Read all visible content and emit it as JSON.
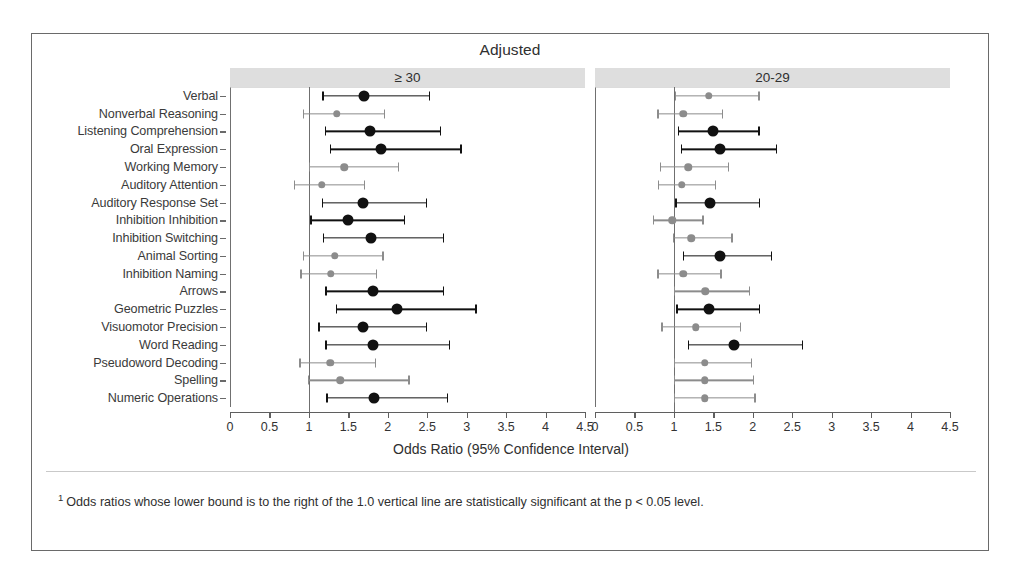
{
  "figure": {
    "title": "Adjusted",
    "x_axis_title": "Odds Ratio (95% Confidence Interval)",
    "footnote_marker": "1",
    "footnote": "Odds ratios whose lower bound is to the right of the 1.0 vertical line are statistically significant at the p < 0.05 level.",
    "reference_value": "1.0",
    "colors": {
      "significant": "#111111",
      "nonsignificant": "#8c8c8c",
      "panel_header_bg": "#dedede",
      "frame": "#6a6a6a",
      "axis": "#5f5f5f"
    }
  },
  "chart_data": {
    "type": "scatter",
    "subtype": "forest-plot",
    "title": "Adjusted",
    "xlabel": "Odds Ratio (95% Confidence Interval)",
    "ylabel": "",
    "xlim": [
      0,
      4.5
    ],
    "xticks": [
      "0",
      "0.5",
      "1",
      "1.5",
      "2",
      "2.5",
      "3",
      "3.5",
      "4",
      "4.5"
    ],
    "xtick_values": [
      0,
      0.5,
      1,
      1.5,
      2,
      2.5,
      3,
      3.5,
      4,
      4.5
    ],
    "grid": false,
    "legend_position": "none",
    "reference_line": 1.0,
    "categories": [
      "Verbal",
      "Nonverbal Reasoning",
      "Listening Comprehension",
      "Oral Expression",
      "Working Memory",
      "Auditory Attention",
      "Auditory Response Set",
      "Inhibition Inhibition",
      "Inhibition Switching",
      "Animal Sorting",
      "Inhibition Naming",
      "Arrows",
      "Geometric Puzzles",
      "Visuomotor Precision",
      "Word Reading",
      "Pseudoword Decoding",
      "Spelling",
      "Numeric Operations"
    ],
    "panels": [
      {
        "label": "≥ 30",
        "name": "ge-30",
        "points": [
          {
            "category": "Verbal",
            "or": 1.7,
            "lo": 1.17,
            "hi": 2.52,
            "significant": true
          },
          {
            "category": "Nonverbal Reasoning",
            "or": 1.35,
            "lo": 0.92,
            "hi": 1.95,
            "significant": false
          },
          {
            "category": "Listening Comprehension",
            "or": 1.78,
            "lo": 1.2,
            "hi": 2.66,
            "significant": true
          },
          {
            "category": "Oral Expression",
            "or": 1.92,
            "lo": 1.27,
            "hi": 2.92,
            "significant": true
          },
          {
            "category": "Working Memory",
            "or": 1.45,
            "lo": 1.0,
            "hi": 2.13,
            "significant": false
          },
          {
            "category": "Auditory Attention",
            "or": 1.16,
            "lo": 0.81,
            "hi": 1.7,
            "significant": false
          },
          {
            "category": "Auditory Response Set",
            "or": 1.69,
            "lo": 1.16,
            "hi": 2.48,
            "significant": true
          },
          {
            "category": "Inhibition Inhibition",
            "or": 1.5,
            "lo": 1.02,
            "hi": 2.2,
            "significant": true
          },
          {
            "category": "Inhibition Switching",
            "or": 1.79,
            "lo": 1.18,
            "hi": 2.7,
            "significant": true
          },
          {
            "category": "Animal Sorting",
            "or": 1.33,
            "lo": 0.92,
            "hi": 1.93,
            "significant": false
          },
          {
            "category": "Inhibition Naming",
            "or": 1.28,
            "lo": 0.89,
            "hi": 1.85,
            "significant": false
          },
          {
            "category": "Arrows",
            "or": 1.81,
            "lo": 1.21,
            "hi": 2.7,
            "significant": true
          },
          {
            "category": "Geometric Puzzles",
            "or": 2.12,
            "lo": 1.34,
            "hi": 3.11,
            "significant": true
          },
          {
            "category": "Visuomotor Precision",
            "or": 1.69,
            "lo": 1.12,
            "hi": 2.48,
            "significant": true
          },
          {
            "category": "Word Reading",
            "or": 1.81,
            "lo": 1.21,
            "hi": 2.77,
            "significant": true
          },
          {
            "category": "Pseudoword Decoding",
            "or": 1.27,
            "lo": 0.88,
            "hi": 1.84,
            "significant": false
          },
          {
            "category": "Spelling",
            "or": 1.4,
            "lo": 0.99,
            "hi": 2.26,
            "significant": false
          },
          {
            "category": "Numeric Operations",
            "or": 1.83,
            "lo": 1.22,
            "hi": 2.75,
            "significant": true
          }
        ]
      },
      {
        "label": "20-29",
        "name": "20-29",
        "points": [
          {
            "category": "Verbal",
            "or": 1.44,
            "lo": 1.01,
            "hi": 2.07,
            "significant": false
          },
          {
            "category": "Nonverbal Reasoning",
            "or": 1.12,
            "lo": 0.79,
            "hi": 1.61,
            "significant": false
          },
          {
            "category": "Listening Comprehension",
            "or": 1.49,
            "lo": 1.05,
            "hi": 2.07,
            "significant": true
          },
          {
            "category": "Oral Expression",
            "or": 1.59,
            "lo": 1.09,
            "hi": 2.29,
            "significant": true
          },
          {
            "category": "Working Memory",
            "or": 1.18,
            "lo": 0.82,
            "hi": 1.68,
            "significant": false
          },
          {
            "category": "Auditory Attention",
            "or": 1.1,
            "lo": 0.8,
            "hi": 1.52,
            "significant": false
          },
          {
            "category": "Auditory Response Set",
            "or": 1.46,
            "lo": 1.02,
            "hi": 2.08,
            "significant": true
          },
          {
            "category": "Inhibition Inhibition",
            "or": 0.98,
            "lo": 0.73,
            "hi": 1.36,
            "significant": false
          },
          {
            "category": "Inhibition Switching",
            "or": 1.22,
            "lo": 0.99,
            "hi": 1.73,
            "significant": false
          },
          {
            "category": "Animal Sorting",
            "or": 1.59,
            "lo": 1.11,
            "hi": 2.23,
            "significant": true
          },
          {
            "category": "Inhibition Naming",
            "or": 1.12,
            "lo": 0.79,
            "hi": 1.59,
            "significant": false
          },
          {
            "category": "Arrows",
            "or": 1.4,
            "lo": 1.0,
            "hi": 1.95,
            "significant": false
          },
          {
            "category": "Geometric Puzzles",
            "or": 1.45,
            "lo": 1.03,
            "hi": 2.08,
            "significant": true
          },
          {
            "category": "Visuomotor Precision",
            "or": 1.28,
            "lo": 0.84,
            "hi": 1.84,
            "significant": false
          },
          {
            "category": "Word Reading",
            "or": 1.76,
            "lo": 1.18,
            "hi": 2.62,
            "significant": true
          },
          {
            "category": "Pseudoword Decoding",
            "or": 1.39,
            "lo": 1.0,
            "hi": 1.98,
            "significant": false
          },
          {
            "category": "Spelling",
            "or": 1.39,
            "lo": 1.0,
            "hi": 2.0,
            "significant": false
          },
          {
            "category": "Numeric Operations",
            "or": 1.39,
            "lo": 1.0,
            "hi": 2.02,
            "significant": false
          }
        ]
      }
    ]
  }
}
